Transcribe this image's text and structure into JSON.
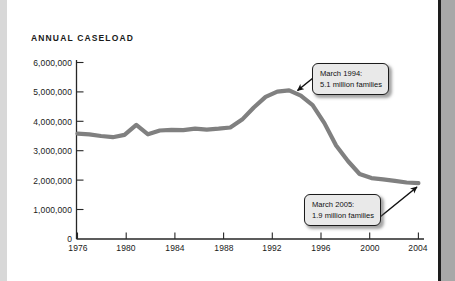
{
  "chart_data": {
    "type": "line",
    "title": "ANNUAL CASELOAD",
    "xlabel": "",
    "ylabel": "",
    "xlim": [
      1976,
      2005.3
    ],
    "ylim": [
      0,
      6000000
    ],
    "grid": false,
    "legend": "none",
    "line_color": "#808080",
    "xticks": [
      "1976",
      "1980",
      "1984",
      "1988",
      "1992",
      "1996",
      "2000",
      "2004"
    ],
    "xtick_values": [
      1976,
      1980,
      1984,
      1988,
      1992,
      1996,
      2000,
      2004
    ],
    "yticks": [
      "0",
      "1,000,000",
      "2,000,000",
      "3,000,000",
      "4,000,000",
      "5,000,000",
      "6,000,000"
    ],
    "ytick_values": [
      0,
      1000000,
      2000000,
      3000000,
      4000000,
      5000000,
      6000000
    ],
    "x": [
      1976,
      1977,
      1978,
      1979,
      1980,
      1981,
      1982,
      1983,
      1984,
      1985,
      1986,
      1987,
      1988,
      1989,
      1990,
      1991,
      1992,
      1993,
      1994,
      1995,
      1996,
      1997,
      1998,
      1999,
      2000,
      2001,
      2002,
      2003,
      2004,
      2005
    ],
    "values": [
      3580000,
      3560000,
      3500000,
      3460000,
      3540000,
      3880000,
      3560000,
      3690000,
      3710000,
      3700000,
      3750000,
      3720000,
      3750000,
      3790000,
      4060000,
      4470000,
      4830000,
      5010000,
      5050000,
      4870000,
      4550000,
      3940000,
      3180000,
      2650000,
      2210000,
      2070000,
      2030000,
      1980000,
      1920000,
      1900000
    ],
    "annotations": [
      {
        "name": "peak-callout",
        "line1": "March 1994:",
        "line2": "5.1 million families",
        "point_x": 1994,
        "point_y": 5100000
      },
      {
        "name": "end-callout",
        "line1": "March 2005:",
        "line2": "1.9 million families",
        "point_x": 2005,
        "point_y": 1900000
      }
    ]
  }
}
